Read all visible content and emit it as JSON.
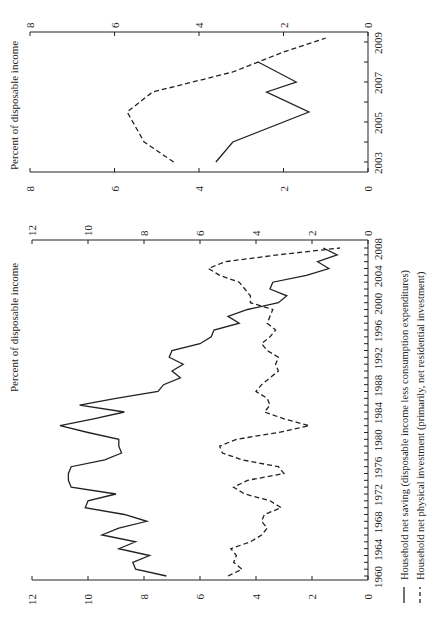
{
  "figure": {
    "orientation": "rotated-90-ccw",
    "legend": {
      "items": [
        {
          "style": "solid",
          "label": "Household net saving (disposable income less consumption expenditures)"
        },
        {
          "style": "dashed",
          "label": "Household net physical investment (primarily, net residential investment)"
        }
      ]
    }
  },
  "chart_data": [
    {
      "type": "line",
      "title": "",
      "xlabel": "",
      "ylabel": "Percent of disposable income",
      "ylim": [
        0,
        12
      ],
      "yticks": [
        0,
        2,
        4,
        6,
        8,
        10,
        12
      ],
      "xlim": [
        1960,
        2008
      ],
      "xticks": [
        1960,
        1964,
        1968,
        1972,
        1976,
        1980,
        1984,
        1988,
        1992,
        1996,
        2000,
        2004,
        2008
      ],
      "grid": false,
      "legend_position": "below",
      "x": [
        1960,
        1961,
        1962,
        1963,
        1964,
        1965,
        1966,
        1967,
        1968,
        1969,
        1970,
        1971,
        1972,
        1973,
        1974,
        1975,
        1976,
        1977,
        1978,
        1979,
        1980,
        1981,
        1982,
        1983,
        1984,
        1985,
        1986,
        1987,
        1988,
        1989,
        1990,
        1991,
        1992,
        1993,
        1994,
        1995,
        1996,
        1997,
        1998,
        1999,
        2000,
        2001,
        2002,
        2003,
        2004,
        2005,
        2006,
        2007,
        2008
      ],
      "series": [
        {
          "name": "Household net saving (disposable income less consumption expenditures)",
          "style": "solid",
          "values": [
            7.2,
            8.3,
            8.4,
            7.8,
            8.9,
            8.3,
            9.5,
            8.9,
            7.9,
            8.7,
            10.1,
            10.0,
            9.0,
            10.6,
            10.7,
            10.7,
            10.6,
            9.4,
            8.8,
            8.9,
            8.9,
            10.0,
            11.0,
            9.8,
            8.7,
            10.3,
            9.0,
            7.5,
            7.3,
            6.7,
            7.0,
            6.6,
            7.1,
            7.0,
            6.0,
            5.6,
            5.5,
            4.6,
            5.0,
            4.3,
            3.2,
            2.9,
            3.5,
            3.4,
            2.2,
            1.4,
            1.8,
            1.1,
            1.6
          ]
        },
        {
          "name": "Household net physical investment (primarily, net residential investment)",
          "style": "dashed",
          "values": [
            5.0,
            4.5,
            4.8,
            4.7,
            4.9,
            4.2,
            3.8,
            3.6,
            3.8,
            3.7,
            3.1,
            3.5,
            4.4,
            4.8,
            4.3,
            3.0,
            3.2,
            4.5,
            5.2,
            5.3,
            4.7,
            3.2,
            2.1,
            3.0,
            3.7,
            3.5,
            3.6,
            4.0,
            3.8,
            3.5,
            3.2,
            3.3,
            3.2,
            3.6,
            3.8,
            3.5,
            3.3,
            3.6,
            3.5,
            3.4,
            4.2,
            4.2,
            4.4,
            4.6,
            5.3,
            5.7,
            5.1,
            3.2,
            1.0
          ]
        }
      ]
    },
    {
      "type": "line",
      "title": "",
      "xlabel": "",
      "ylabel": "Percent of disposable income",
      "ylim": [
        0,
        8
      ],
      "yticks": [
        0,
        2,
        4,
        6,
        8
      ],
      "xlim": [
        2003,
        2009
      ],
      "xticks": [
        2003,
        2005,
        2007,
        2009
      ],
      "grid": false,
      "x": [
        2003.0,
        2004.0,
        2005.5,
        2006.5,
        2007.0,
        2008.0
      ],
      "x_dashed": [
        2003.0,
        2004.0,
        2005.5,
        2006.5,
        2007.5,
        2008.5,
        2009.2
      ],
      "series": [
        {
          "name": "Household net saving (disposable income less consumption expenditures)",
          "style": "solid",
          "values": [
            3.6,
            3.2,
            1.4,
            2.4,
            1.7,
            2.6
          ]
        },
        {
          "name": "Household net physical investment (primarily, net residential investment)",
          "style": "dashed",
          "values": [
            4.6,
            5.3,
            5.7,
            5.1,
            3.2,
            2.0,
            1.0
          ]
        }
      ]
    }
  ]
}
